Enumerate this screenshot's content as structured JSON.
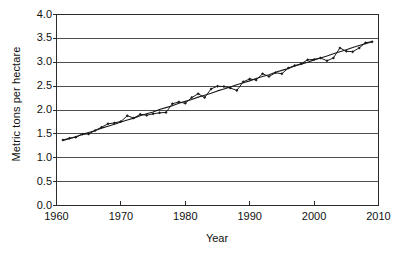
{
  "chart_data": {
    "type": "line",
    "title": "",
    "xlabel": "Year",
    "ylabel": "Metric tons per hectare",
    "xlim": [
      1960,
      2010
    ],
    "ylim": [
      0.0,
      4.0
    ],
    "grid": "horizontal",
    "legend": "none",
    "xticks": [
      "1960",
      "1970",
      "1980",
      "1990",
      "2000",
      "2010"
    ],
    "xtick_values": [
      1960,
      1970,
      1980,
      1990,
      2000,
      2010
    ],
    "yticks": [
      "0.0",
      "0.5",
      "1.0",
      "1.5",
      "2.0",
      "2.5",
      "3.0",
      "3.5",
      "4.0"
    ],
    "ytick_values": [
      0.0,
      0.5,
      1.0,
      1.5,
      2.0,
      2.5,
      3.0,
      3.5,
      4.0
    ],
    "x": [
      1961,
      1962,
      1963,
      1964,
      1965,
      1966,
      1967,
      1968,
      1969,
      1970,
      1971,
      1972,
      1973,
      1974,
      1975,
      1976,
      1977,
      1978,
      1979,
      1980,
      1981,
      1982,
      1983,
      1984,
      1985,
      1986,
      1987,
      1988,
      1989,
      1990,
      1991,
      1992,
      1993,
      1994,
      1995,
      1996,
      1997,
      1998,
      1999,
      2000,
      2001,
      2002,
      2003,
      2004,
      2005,
      2006,
      2007,
      2008,
      2009
    ],
    "series": [
      {
        "name": "Cereal yield",
        "marker": "diamond",
        "color": "#1a1a1a",
        "values": [
          1.37,
          1.41,
          1.43,
          1.49,
          1.5,
          1.57,
          1.64,
          1.71,
          1.73,
          1.76,
          1.88,
          1.83,
          1.91,
          1.89,
          1.92,
          1.94,
          1.95,
          2.13,
          2.17,
          2.14,
          2.26,
          2.34,
          2.26,
          2.44,
          2.5,
          2.49,
          2.46,
          2.41,
          2.59,
          2.65,
          2.63,
          2.76,
          2.7,
          2.78,
          2.76,
          2.88,
          2.93,
          2.97,
          3.05,
          3.06,
          3.09,
          3.03,
          3.09,
          3.3,
          3.23,
          3.22,
          3.3,
          3.41,
          3.43
        ]
      },
      {
        "name": "Trend",
        "marker": "none",
        "color": "#1a1a1a",
        "values": [
          1.36,
          1.4,
          1.44,
          1.49,
          1.53,
          1.57,
          1.62,
          1.66,
          1.7,
          1.75,
          1.79,
          1.83,
          1.88,
          1.92,
          1.96,
          2.01,
          2.05,
          2.09,
          2.14,
          2.18,
          2.22,
          2.27,
          2.31,
          2.35,
          2.4,
          2.44,
          2.48,
          2.53,
          2.57,
          2.61,
          2.66,
          2.7,
          2.74,
          2.79,
          2.83,
          2.87,
          2.92,
          2.96,
          3.0,
          3.05,
          3.09,
          3.13,
          3.18,
          3.22,
          3.26,
          3.31,
          3.35,
          3.39,
          3.43
        ]
      }
    ]
  },
  "axis": {
    "x_title": "Year",
    "y_title": "Metric tons per hectare"
  }
}
